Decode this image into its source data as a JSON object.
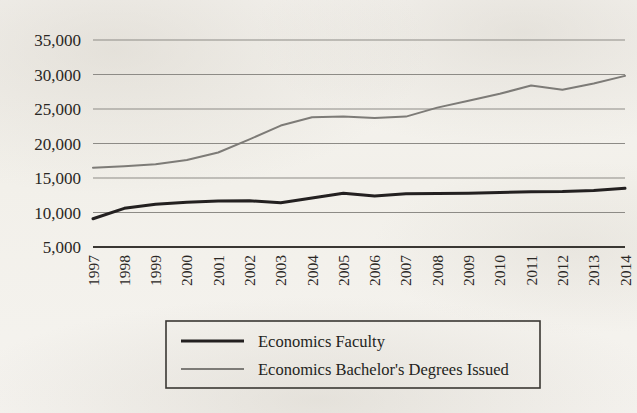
{
  "chart_data": {
    "type": "line",
    "title": "",
    "subtitle": "",
    "xlabel": "",
    "ylabel": "",
    "x": [
      1997,
      1998,
      1999,
      2000,
      2001,
      2002,
      2003,
      2004,
      2005,
      2006,
      2007,
      2008,
      2009,
      2010,
      2011,
      2012,
      2013,
      2014
    ],
    "categories": [
      "1997",
      "1998",
      "1999",
      "2000",
      "2001",
      "2002",
      "2003",
      "2004",
      "2005",
      "2006",
      "2007",
      "2008",
      "2009",
      "2010",
      "2011",
      "2012",
      "2013",
      "2014"
    ],
    "series": [
      {
        "name": "Economics Faculty",
        "color": "#232020",
        "width": 3.0,
        "values": [
          9100,
          10600,
          11200,
          11500,
          11650,
          11700,
          11400,
          12100,
          12800,
          12400,
          12700,
          12750,
          12800,
          12900,
          13000,
          13050,
          13200,
          13500
        ]
      },
      {
        "name": "Economics Bachelor's Degrees Issued",
        "color": "#7d7b77",
        "width": 2.0,
        "values": [
          16500,
          16700,
          17000,
          17600,
          18700,
          20600,
          22600,
          23800,
          23900,
          23700,
          23900,
          25200,
          26200,
          27200,
          28400,
          27800,
          28700,
          29800
        ]
      }
    ],
    "ylim": [
      5000,
      35000
    ],
    "ytick_values": [
      35000,
      30000,
      25000,
      20000,
      15000,
      10000,
      5000
    ],
    "ytick_labels": [
      "35,000",
      "30,000",
      "25,000",
      "20,000",
      "15,000",
      "10,000",
      "5,000"
    ],
    "grid": true,
    "grid_axis": "y",
    "legend_position": "bottom",
    "xtick_rotation": 90
  },
  "legend": {
    "entries": [
      {
        "label": "Economics Faculty",
        "swatch": "line-swatch-dark"
      },
      {
        "label": "Economics Bachelor's Degrees Issued",
        "swatch": "line-swatch-gray"
      }
    ]
  }
}
